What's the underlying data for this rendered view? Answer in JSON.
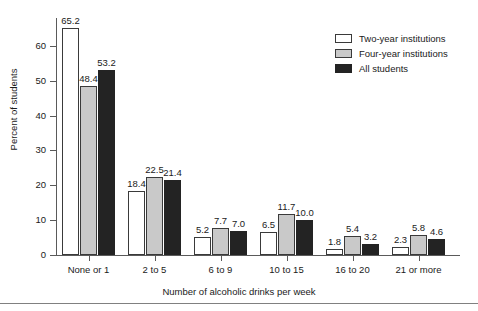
{
  "chart_data": {
    "type": "bar",
    "title": "",
    "xlabel": "Number of alcoholic drinks per week",
    "ylabel": "Percent of students",
    "categories": [
      "None or 1",
      "2 to 5",
      "6 to 9",
      "10 to 15",
      "16 to 20",
      "21 or more"
    ],
    "ylim": [
      0,
      68
    ],
    "yticks": [
      0,
      10,
      20,
      30,
      40,
      50,
      60
    ],
    "ytick_labels": [
      "0",
      "10",
      "20",
      "30",
      "40",
      "50",
      "60"
    ],
    "grid": false,
    "legend_position": "top-right",
    "series": [
      {
        "name": "Two-year institutions",
        "color": "#ffffff",
        "values": [
          65.2,
          18.4,
          5.2,
          6.5,
          1.8,
          2.3
        ],
        "labels": [
          "65.2",
          "18.4",
          "5.2",
          "6.5",
          "1.8",
          "2.3"
        ]
      },
      {
        "name": "Four-year institutions",
        "color": "#c9c9c9",
        "values": [
          48.4,
          22.5,
          7.7,
          11.7,
          5.4,
          5.8
        ],
        "labels": [
          "48.4",
          "22.5",
          "7.7",
          "11.7",
          "5.4",
          "5.8"
        ]
      },
      {
        "name": "All students",
        "color": "#232323",
        "values": [
          53.2,
          21.4,
          7.0,
          10.0,
          3.2,
          4.6
        ],
        "labels": [
          "53.2",
          "21.4",
          "7.0",
          "10.0",
          "3.2",
          "4.6"
        ]
      }
    ]
  },
  "legend": {
    "items": [
      {
        "label": "Two-year institutions",
        "swatch": "legend-swatch-two-year"
      },
      {
        "label": "Four-year institutions",
        "swatch": "legend-swatch-four-year"
      },
      {
        "label": "All students",
        "swatch": "legend-swatch-all-students"
      }
    ]
  },
  "axes": {
    "y_title": "Percent of students",
    "x_title": "Number of alcoholic drinks per week"
  }
}
